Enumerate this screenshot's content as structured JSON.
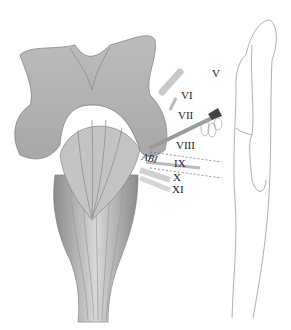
{
  "figure": {
    "labels": {
      "v": "V",
      "vi": "VI",
      "vii": "VII",
      "viii": "VIII",
      "abi": "ABI",
      "ix": "IX",
      "x": "X",
      "xi": "XI"
    }
  }
}
